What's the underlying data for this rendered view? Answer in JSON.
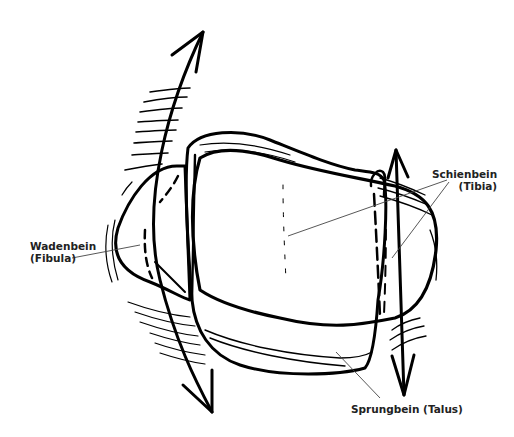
{
  "figure": {
    "labels": {
      "tibia": {
        "line1": "Schienbein",
        "line2": "(Tibia)"
      },
      "fibula": {
        "line1": "Wadenbein",
        "line2": "(Fibula)"
      },
      "talus": {
        "line1": "Sprungbein (Talus)"
      }
    },
    "colors": {
      "stroke": "#000000",
      "background": "#ffffff",
      "leader": "#444444"
    }
  }
}
